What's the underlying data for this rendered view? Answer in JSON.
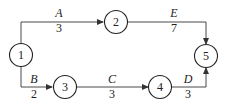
{
  "diagram": {
    "type": "activity-on-arrow network",
    "nodes": [
      {
        "id": "1",
        "label": "1"
      },
      {
        "id": "2",
        "label": "2"
      },
      {
        "id": "3",
        "label": "3"
      },
      {
        "id": "4",
        "label": "4"
      },
      {
        "id": "5",
        "label": "5"
      }
    ],
    "edges": [
      {
        "from": "1",
        "to": "2",
        "activity": "A",
        "duration": "3"
      },
      {
        "from": "1",
        "to": "3",
        "activity": "B",
        "duration": "2"
      },
      {
        "from": "3",
        "to": "4",
        "activity": "C",
        "duration": "3"
      },
      {
        "from": "4",
        "to": "5",
        "activity": "D",
        "duration": "3"
      },
      {
        "from": "2",
        "to": "5",
        "activity": "E",
        "duration": "7"
      }
    ]
  }
}
